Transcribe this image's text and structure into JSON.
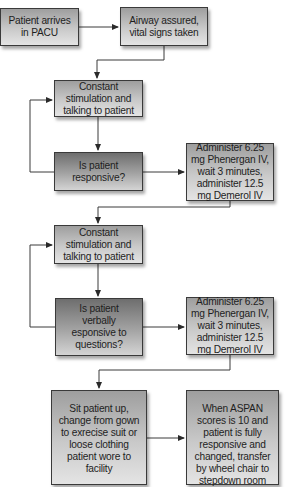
{
  "flowchart": {
    "nodes": [
      {
        "id": "n1",
        "label": "Patient arrives in PACU",
        "type": "process"
      },
      {
        "id": "n2",
        "label": "Airway assured, vital signs taken",
        "type": "process"
      },
      {
        "id": "n3",
        "label": "Constant stimulation and talking to patient",
        "type": "process"
      },
      {
        "id": "n4",
        "label": "Is patient responsive?",
        "type": "decision"
      },
      {
        "id": "n5",
        "label": "Administer 6.25 mg Phenergan IV, wait 3 minutes, administer 12.5 mg Demerol IV",
        "type": "process"
      },
      {
        "id": "n6",
        "label": "Constant stimulation and talking to patient",
        "type": "process"
      },
      {
        "id": "n7",
        "label": "Is patient verbally esponsive to questions?",
        "type": "decision"
      },
      {
        "id": "n8",
        "label": "Administer 6.25 mg Phenergan IV, wait 3 minutes, administer 12.5 mg Demerol IV",
        "type": "process"
      },
      {
        "id": "n9",
        "label": "Sit patient up, change from gown to exrecise suit or loose clothing patient wore to facility",
        "type": "process"
      },
      {
        "id": "n10",
        "label": "When ASPAN scores is 10 and patient is fully responsive and changed, transfer by wheel chair to stepdown room",
        "type": "process"
      }
    ],
    "edges": [
      {
        "from": "n1",
        "to": "n2"
      },
      {
        "from": "n2",
        "to": "n3"
      },
      {
        "from": "n3",
        "to": "n4"
      },
      {
        "from": "n4",
        "to": "n3",
        "note": "loop back"
      },
      {
        "from": "n4",
        "to": "n5"
      },
      {
        "from": "n5",
        "to": "n6"
      },
      {
        "from": "n6",
        "to": "n7"
      },
      {
        "from": "n7",
        "to": "n6",
        "note": "loop back"
      },
      {
        "from": "n7",
        "to": "n8"
      },
      {
        "from": "n8",
        "to": "n9"
      },
      {
        "from": "n9",
        "to": "n10"
      }
    ]
  },
  "colors": {
    "line": "#3a3a3a",
    "box_light_top": "#9e9e9e",
    "box_light_bottom": "#e4e4e4",
    "box_dark_top": "#6e6e6e",
    "box_dark_bottom": "#d4d4d4"
  }
}
